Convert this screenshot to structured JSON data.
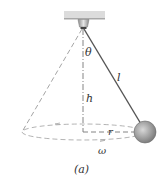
{
  "diagram": {
    "caption": "(a)",
    "labels": {
      "theta": "θ",
      "length": "l",
      "height": "h",
      "radius": "r",
      "omega": "ω"
    },
    "colors": {
      "ceiling": "#d9d9d9",
      "string": "#555555",
      "dashed": "#9a9a9a",
      "ball": "#9c9c9c",
      "text": "#333333"
    }
  }
}
